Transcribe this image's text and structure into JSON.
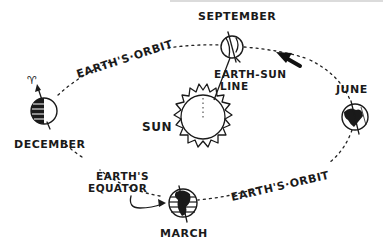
{
  "diagram": {
    "labels": {
      "september": "SEPTEMBER",
      "june": "JUNE",
      "december": "DECEMBER",
      "march": "MARCH",
      "sun": "SUN",
      "earth_sun_line_1": "EARTH-SUN",
      "earth_sun_line_2": "LINE",
      "orbit_top": "EARTH'S·ORBIT",
      "orbit_bottom": "EARTH'S·ORBIT",
      "equator_1": "EARTH'S",
      "equator_2": "EQUATOR",
      "north_symbol": "♈"
    },
    "positions": [
      {
        "name": "September",
        "x": 232,
        "y": 47
      },
      {
        "name": "June",
        "x": 355,
        "y": 117
      },
      {
        "name": "December",
        "x": 44,
        "y": 105
      },
      {
        "name": "March",
        "x": 183,
        "y": 203
      },
      {
        "name": "Sun",
        "x": 203,
        "y": 118
      }
    ],
    "colors": {
      "ink": "#1a1a1a",
      "background": "#ffffff"
    }
  }
}
